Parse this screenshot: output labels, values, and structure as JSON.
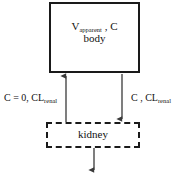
{
  "diagram": {
    "body_compartment": {
      "volume_symbol": "V",
      "volume_subscript": "apparent",
      "separator": " , ",
      "concentration_symbol": "C",
      "label": "body"
    },
    "kidney_compartment": {
      "label": "kidney"
    },
    "flows": {
      "inflow_left": {
        "concentration": "C = 0,",
        "clearance_symbol": "CL",
        "clearance_subscript": "renal",
        "direction": "up"
      },
      "outflow_right": {
        "concentration": "C ,",
        "clearance_symbol": "CL",
        "clearance_subscript": "renal",
        "direction": "down"
      },
      "excretion_bottom": {
        "direction": "down"
      }
    },
    "colors": {
      "stroke": "#1a1a1a",
      "text": "#111111",
      "background": "#ffffff",
      "arrow": "#3a3a3a"
    }
  }
}
